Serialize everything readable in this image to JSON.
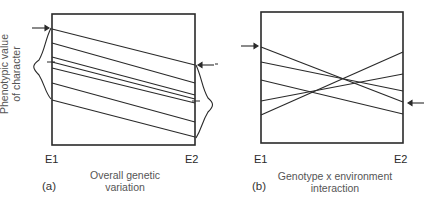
{
  "figure": {
    "y_axis_label_line1": "Phenotypic value",
    "y_axis_label_line2": "of character",
    "panels": [
      {
        "tag": "(a)",
        "env_left": "E1",
        "env_right": "E2",
        "caption_line1": "Overall genetic",
        "caption_line2": "variation",
        "box": {
          "x1": 52,
          "y1": 14,
          "x2": 195,
          "y2": 145
        },
        "lines": [
          {
            "y_e1": 29,
            "y_e2": 65
          },
          {
            "y_e1": 43,
            "y_e2": 83
          },
          {
            "y_e1": 57,
            "y_e2": 95
          },
          {
            "y_e1": 62,
            "y_e2": 99
          },
          {
            "y_e1": 68,
            "y_e2": 103
          },
          {
            "y_e1": 83,
            "y_e2": 122
          },
          {
            "y_e1": 100,
            "y_e2": 137
          }
        ]
      },
      {
        "tag": "(b)",
        "env_left": "E1",
        "env_right": "E2",
        "caption_line1": "Genotype x environment",
        "caption_line2": "interaction",
        "box": {
          "x1": 261,
          "y1": 12,
          "x2": 403,
          "y2": 143
        },
        "lines": [
          {
            "y_e1": 47,
            "y_e2": 102
          },
          {
            "y_e1": 62,
            "y_e2": 91
          },
          {
            "y_e1": 80,
            "y_e2": 114
          },
          {
            "y_e1": 101,
            "y_e2": 74
          },
          {
            "y_e1": 115,
            "y_e2": 52
          }
        ]
      }
    ]
  }
}
